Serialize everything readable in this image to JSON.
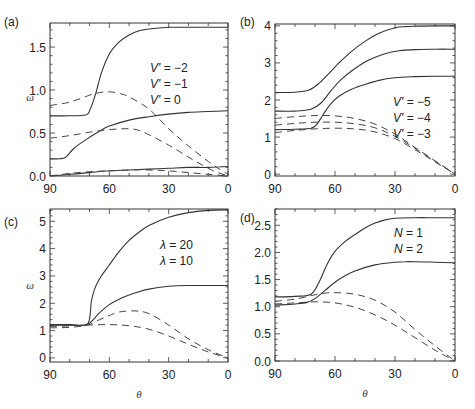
{
  "figure": {
    "x_axis_symbol": "θ",
    "y_axis_symbol": "ω"
  },
  "chart_data": [
    {
      "id": "a",
      "type": "line",
      "panel_label": "(a)",
      "xlabel": "",
      "ylabel": "ω",
      "xlim": [
        90,
        0
      ],
      "ylim": [
        0,
        1.78
      ],
      "xticks": [
        "90",
        "60",
        "30",
        "0"
      ],
      "yticks": [
        "0.0",
        "0.5",
        "1.0",
        "1.5"
      ],
      "ytick_values": [
        0,
        0.5,
        1.0,
        1.5
      ],
      "legend": [
        "V' = −2",
        "V' = −1",
        "V' = 0"
      ],
      "legend_pos": [
        150,
        72
      ],
      "series": [
        {
          "name": "V' = −2 (solid)",
          "style": "solid",
          "x": [
            90,
            80,
            72,
            70,
            67,
            64,
            60,
            55,
            50,
            45,
            40,
            30,
            20,
            10,
            0
          ],
          "y": [
            0.7,
            0.7,
            0.71,
            0.76,
            0.95,
            1.2,
            1.42,
            1.56,
            1.64,
            1.69,
            1.71,
            1.73,
            1.73,
            1.73,
            1.73
          ]
        },
        {
          "name": "V' = −2 (dashed)",
          "style": "dashed",
          "x": [
            90,
            80,
            70,
            65,
            60,
            55,
            50,
            40,
            30,
            20,
            10,
            5,
            0
          ],
          "y": [
            0.82,
            0.86,
            0.94,
            0.97,
            0.98,
            0.96,
            0.92,
            0.78,
            0.55,
            0.35,
            0.17,
            0.09,
            0.02
          ]
        },
        {
          "name": "V' = −1 (solid)",
          "style": "solid",
          "x": [
            90,
            85,
            82,
            78,
            72,
            65,
            60,
            50,
            40,
            30,
            20,
            10,
            0
          ],
          "y": [
            0.2,
            0.2,
            0.22,
            0.32,
            0.42,
            0.52,
            0.58,
            0.65,
            0.69,
            0.72,
            0.74,
            0.75,
            0.76
          ]
        },
        {
          "name": "V' = −1 (dashed)",
          "style": "dashed",
          "x": [
            90,
            80,
            70,
            60,
            50,
            45,
            40,
            30,
            20,
            10,
            5,
            0
          ],
          "y": [
            0.44,
            0.47,
            0.51,
            0.54,
            0.55,
            0.53,
            0.48,
            0.36,
            0.22,
            0.09,
            0.04,
            0.0
          ]
        },
        {
          "name": "V' = 0 (solid)",
          "style": "solid",
          "x": [
            90,
            80,
            70,
            60,
            50,
            40,
            30,
            20,
            10,
            0
          ],
          "y": [
            0.0,
            0.02,
            0.04,
            0.06,
            0.07,
            0.08,
            0.09,
            0.1,
            0.1,
            0.11
          ]
        },
        {
          "name": "V' = 0 (dashed)",
          "style": "dashed",
          "x": [
            90,
            80,
            70,
            60,
            50,
            40,
            30,
            20,
            10,
            0
          ],
          "y": [
            0.0,
            0.03,
            0.05,
            0.06,
            0.07,
            0.07,
            0.06,
            0.04,
            0.02,
            0.0
          ]
        }
      ]
    },
    {
      "id": "b",
      "type": "line",
      "panel_label": "(b)",
      "xlabel": "",
      "ylabel": "",
      "xlim": [
        90,
        0
      ],
      "ylim": [
        -0.05,
        4.05
      ],
      "xticks": [
        "90",
        "60",
        "30",
        "0"
      ],
      "yticks": [
        "0",
        "1",
        "2",
        "3",
        "4"
      ],
      "ytick_values": [
        0,
        1,
        2,
        3,
        4
      ],
      "legend": [
        "V' = −5",
        "V' = −4",
        "V' = −3"
      ],
      "legend_pos": [
        393,
        106
      ],
      "series": [
        {
          "name": "V' = −5 (solid)",
          "style": "solid",
          "x": [
            90,
            80,
            73,
            68,
            63,
            58,
            52,
            45,
            38,
            30,
            25,
            20,
            10,
            0
          ],
          "y": [
            2.2,
            2.21,
            2.27,
            2.45,
            2.72,
            3.0,
            3.3,
            3.58,
            3.8,
            3.95,
            3.98,
            3.99,
            4.0,
            4.0
          ]
        },
        {
          "name": "V' = −4 (solid)",
          "style": "solid",
          "x": [
            90,
            80,
            72,
            67,
            62,
            57,
            50,
            43,
            35,
            28,
            20,
            10,
            0
          ],
          "y": [
            1.7,
            1.7,
            1.75,
            1.92,
            2.25,
            2.55,
            2.85,
            3.08,
            3.25,
            3.33,
            3.36,
            3.37,
            3.37
          ]
        },
        {
          "name": "V' = −3 (solid)",
          "style": "solid",
          "x": [
            90,
            80,
            72,
            69,
            66,
            62,
            58,
            52,
            45,
            38,
            30,
            20,
            10,
            0
          ],
          "y": [
            1.2,
            1.21,
            1.24,
            1.35,
            1.6,
            1.9,
            2.1,
            2.28,
            2.42,
            2.53,
            2.6,
            2.63,
            2.64,
            2.64
          ]
        },
        {
          "name": "V' = −5 (dashed)",
          "style": "dashed",
          "x": [
            90,
            80,
            70,
            60,
            50,
            40,
            30,
            20,
            10,
            0
          ],
          "y": [
            1.5,
            1.55,
            1.58,
            1.57,
            1.5,
            1.35,
            1.08,
            0.72,
            0.36,
            0.0
          ]
        },
        {
          "name": "V' = −4 (dashed)",
          "style": "dashed",
          "x": [
            90,
            80,
            70,
            60,
            50,
            40,
            30,
            20,
            10,
            0
          ],
          "y": [
            1.32,
            1.37,
            1.4,
            1.4,
            1.36,
            1.25,
            1.02,
            0.7,
            0.35,
            0.0
          ]
        },
        {
          "name": "V' = −3 (dashed)",
          "style": "dashed",
          "x": [
            90,
            80,
            70,
            60,
            50,
            40,
            30,
            20,
            10,
            0
          ],
          "y": [
            1.12,
            1.18,
            1.22,
            1.24,
            1.22,
            1.14,
            0.96,
            0.66,
            0.33,
            0.0
          ]
        }
      ]
    },
    {
      "id": "c",
      "type": "line",
      "panel_label": "(c)",
      "xlabel": "θ",
      "ylabel": "ω",
      "xlim": [
        90,
        0
      ],
      "ylim": [
        -0.15,
        5.45
      ],
      "xticks": [
        "90",
        "60",
        "30",
        "0"
      ],
      "yticks": [
        "0",
        "1",
        "2",
        "3",
        "4",
        "5"
      ],
      "ytick_values": [
        0,
        1,
        2,
        3,
        4,
        5
      ],
      "legend": [
        "λ = 20",
        "λ = 10"
      ],
      "legend_pos": [
        160,
        249
      ],
      "series": [
        {
          "name": "λ = 20 (solid)",
          "style": "solid",
          "x": [
            90,
            80,
            71,
            69,
            67,
            64,
            60,
            55,
            50,
            45,
            40,
            30,
            20,
            10,
            0
          ],
          "y": [
            1.22,
            1.22,
            1.24,
            2.1,
            2.6,
            3.0,
            3.4,
            3.9,
            4.3,
            4.6,
            4.85,
            5.15,
            5.32,
            5.4,
            5.42
          ]
        },
        {
          "name": "λ = 10 (solid)",
          "style": "solid",
          "x": [
            90,
            80,
            71,
            65,
            60,
            55,
            50,
            45,
            40,
            30,
            20,
            10,
            0
          ],
          "y": [
            1.2,
            1.2,
            1.24,
            1.65,
            1.95,
            2.15,
            2.3,
            2.42,
            2.52,
            2.62,
            2.65,
            2.65,
            2.65
          ]
        },
        {
          "name": "λ = 20 (dashed)",
          "style": "dashed",
          "x": [
            90,
            80,
            71,
            65,
            60,
            55,
            47,
            40,
            30,
            20,
            10,
            0
          ],
          "y": [
            1.1,
            1.12,
            1.2,
            1.4,
            1.55,
            1.68,
            1.72,
            1.62,
            1.2,
            0.7,
            0.3,
            0.0
          ]
        },
        {
          "name": "λ = 10 (dashed)",
          "style": "dashed",
          "x": [
            90,
            80,
            71,
            60,
            50,
            40,
            30,
            20,
            10,
            0
          ],
          "y": [
            1.15,
            1.17,
            1.2,
            1.22,
            1.18,
            1.05,
            0.8,
            0.5,
            0.22,
            0.0
          ]
        }
      ]
    },
    {
      "id": "d",
      "type": "line",
      "panel_label": "(d)",
      "xlabel": "θ",
      "ylabel": "",
      "xlim": [
        90,
        0
      ],
      "ylim": [
        0,
        2.8
      ],
      "xticks": [
        "90",
        "60",
        "30",
        "0"
      ],
      "yticks": [
        "0.0",
        "0.5",
        "1.0",
        "1.5",
        "2.0",
        "2.5"
      ],
      "ytick_values": [
        0,
        0.5,
        1.0,
        1.5,
        2.0,
        2.5
      ],
      "legend": [
        "N = 1",
        "N = 2"
      ],
      "legend_pos": [
        394,
        237
      ],
      "series": [
        {
          "name": "N = 1 (solid)",
          "style": "solid",
          "x": [
            90,
            80,
            72,
            68,
            64,
            60,
            55,
            50,
            45,
            40,
            35,
            30,
            20,
            10,
            0
          ],
          "y": [
            1.18,
            1.19,
            1.23,
            1.45,
            1.78,
            2.02,
            2.2,
            2.33,
            2.45,
            2.54,
            2.6,
            2.63,
            2.64,
            2.64,
            2.64
          ]
        },
        {
          "name": "N = 2 (solid)",
          "style": "solid",
          "x": [
            90,
            80,
            74,
            70,
            65,
            60,
            55,
            50,
            40,
            30,
            25,
            20,
            10,
            0
          ],
          "y": [
            1.03,
            1.05,
            1.08,
            1.15,
            1.3,
            1.45,
            1.57,
            1.66,
            1.77,
            1.82,
            1.83,
            1.83,
            1.82,
            1.81
          ]
        },
        {
          "name": "N = 1 (dashed)",
          "style": "dashed",
          "x": [
            90,
            80,
            70,
            65,
            60,
            50,
            40,
            30,
            20,
            10,
            0
          ],
          "y": [
            1.1,
            1.14,
            1.22,
            1.25,
            1.26,
            1.23,
            1.12,
            0.9,
            0.58,
            0.28,
            0.0
          ]
        },
        {
          "name": "N = 2 (dashed)",
          "style": "dashed",
          "x": [
            90,
            80,
            70,
            60,
            50,
            40,
            30,
            20,
            10,
            0
          ],
          "y": [
            1.05,
            1.07,
            1.09,
            1.07,
            0.99,
            0.85,
            0.66,
            0.43,
            0.2,
            0.0
          ]
        }
      ]
    }
  ]
}
